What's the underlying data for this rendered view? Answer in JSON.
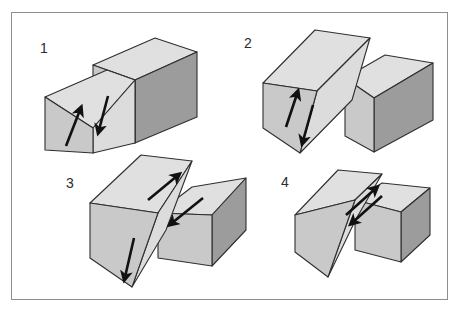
{
  "figure": {
    "domain": "Diagram",
    "caption_visible": false,
    "background_color": "#ffffff",
    "border_color": "#8e8e8e",
    "panel_count": 4
  },
  "palette": {
    "top_face": "#e0e0e0",
    "left_face": "#c9c9c9",
    "right_face": "#9c9c9c",
    "fault_face": "#dcdcdc",
    "outline": "#2f2f2f",
    "arrow": "#111111",
    "label_text": "#2b2b2b"
  },
  "panels": [
    {
      "id": "panel-1",
      "label": "1",
      "label_position": {
        "x": 40,
        "y": 41
      },
      "fault_type": "reverse-dip-slip",
      "description": "Two blocks separated by an inclined fault plane; left-front block moves up, right-rear block moves down.",
      "arrows": [
        {
          "name": "arrow-up-left-block",
          "direction": "up",
          "sense": "hanging-wall-up"
        },
        {
          "name": "arrow-down-right-block",
          "direction": "down",
          "sense": "footwall-down"
        }
      ]
    },
    {
      "id": "panel-2",
      "label": "2",
      "label_position": {
        "x": 244,
        "y": 36
      },
      "fault_type": "normal-dip-slip",
      "description": "Left block elevated exposing the dipping fault surface; arrows show the left block up and the right block down.",
      "arrows": [
        {
          "name": "arrow-up-left-block",
          "direction": "up",
          "sense": "footwall-up"
        },
        {
          "name": "arrow-down-right-block",
          "direction": "down",
          "sense": "hanging-wall-down"
        }
      ]
    },
    {
      "id": "panel-3",
      "label": "3",
      "label_position": {
        "x": 66,
        "y": 176
      },
      "fault_type": "oblique-slip",
      "description": "Combined strike-slip and dip-slip; diagonal arrows on both top surfaces plus a vertical down arrow on the exposed fault face.",
      "arrows": [
        {
          "name": "arrow-up-right-top-left-block",
          "direction": "up-right",
          "sense": "lateral"
        },
        {
          "name": "arrow-down-left-top-right-block",
          "direction": "down-left",
          "sense": "lateral"
        },
        {
          "name": "arrow-down-fault-face",
          "direction": "down",
          "sense": "vertical"
        }
      ]
    },
    {
      "id": "panel-4",
      "label": "4",
      "label_position": {
        "x": 281,
        "y": 175
      },
      "fault_type": "strike-slip",
      "description": "Pure horizontal lateral motion; two antiparallel arrows along the fault trace.",
      "arrows": [
        {
          "name": "arrow-up-right-lateral",
          "direction": "up-right",
          "sense": "lateral"
        },
        {
          "name": "arrow-down-left-lateral",
          "direction": "down-left",
          "sense": "lateral"
        }
      ]
    }
  ]
}
